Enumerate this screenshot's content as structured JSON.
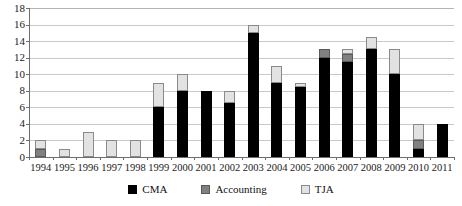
{
  "chart_data": {
    "type": "bar",
    "subtype": "stacked-bar",
    "title": "",
    "xlabel": "",
    "ylabel": "",
    "ylim": [
      0,
      18
    ],
    "ytick_step": 2,
    "yticks": [
      0,
      2,
      4,
      6,
      8,
      10,
      12,
      14,
      16,
      18
    ],
    "ytick_labels": [
      "0",
      "2",
      "4",
      "6",
      "8",
      "10",
      "12",
      "14",
      "16",
      "18"
    ],
    "grid": true,
    "grid_axis": "y",
    "legend_position": "bottom",
    "categories": [
      "1994",
      "1995",
      "1996",
      "1997",
      "1998",
      "1999",
      "2000",
      "2001",
      "2002",
      "2003",
      "2004",
      "2005",
      "2006",
      "2007",
      "2008",
      "2009",
      "2010",
      "2011"
    ],
    "series": [
      {
        "name": "CMA",
        "color": "#000000",
        "values": [
          0,
          0,
          0,
          0,
          0,
          6,
          8,
          8,
          6.5,
          15,
          9,
          8.5,
          12,
          11.5,
          13,
          10,
          1,
          4
        ]
      },
      {
        "name": "Accounting",
        "color": "#808080",
        "values": [
          1,
          0,
          0,
          0,
          0,
          0,
          0,
          0,
          0,
          0,
          0,
          0,
          1,
          1,
          0,
          0,
          1,
          0
        ]
      },
      {
        "name": "TJA",
        "color": "#e2e2e2",
        "values": [
          1,
          1,
          3,
          2,
          2,
          3,
          2,
          0,
          1.5,
          1,
          2,
          0.5,
          0,
          0.5,
          1.5,
          3,
          2,
          0
        ]
      }
    ],
    "totals": [
      2,
      1,
      3,
      2,
      2,
      9,
      10,
      8,
      8,
      16,
      11,
      9,
      13,
      13,
      14.5,
      13,
      4,
      4
    ]
  },
  "legend": {
    "items": [
      {
        "label": "CMA",
        "swatch": "black-square-swatch"
      },
      {
        "label": "Accounting",
        "swatch": "gray-square-swatch"
      },
      {
        "label": "TJA",
        "swatch": "light-gray-square-swatch"
      }
    ]
  }
}
